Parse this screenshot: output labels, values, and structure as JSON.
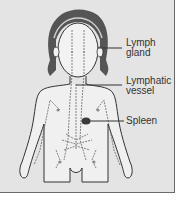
{
  "diagram": {
    "labels": [
      {
        "id": "lymph-gland",
        "line1": "Lymph",
        "line2": "gland"
      },
      {
        "id": "lymphatic-vessel",
        "line1": "Lymphatic",
        "line2": "vessel"
      },
      {
        "id": "spleen",
        "line1": "Spleen",
        "line2": ""
      }
    ],
    "colors": {
      "background": "#e4e4e4",
      "outline": "#333333",
      "hair": "#5a5a5a",
      "spleen": "#3a3a3a",
      "vessel": "#666666"
    }
  }
}
